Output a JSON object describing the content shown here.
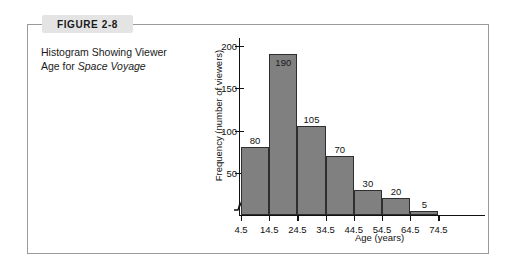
{
  "figure": {
    "badge_label": "FIGURE 2-8",
    "caption_line1": "Histogram Showing Viewer",
    "caption_line2_prefix": "Age for ",
    "caption_line2_italic": "Space Voyage"
  },
  "colors": {
    "bar_fill": "#808080",
    "bar_stroke": "#2e2e2e",
    "frame": "#9a9a9a",
    "badge_bg": "#e4e4e4",
    "text": "#1a1a1a"
  },
  "chart_data": {
    "type": "bar",
    "title": "Histogram Showing Viewer Age for Space Voyage",
    "xlabel": "Age (years)",
    "ylabel": "Frequency (number of viewers)",
    "categories": [
      "4.5-14.5",
      "14.5-24.5",
      "24.5-34.5",
      "34.5-44.5",
      "44.5-54.5",
      "54.5-64.5",
      "64.5-74.5"
    ],
    "values": [
      80,
      190,
      105,
      70,
      30,
      20,
      5
    ],
    "bin_edges": [
      4.5,
      14.5,
      24.5,
      34.5,
      44.5,
      54.5,
      64.5,
      74.5
    ],
    "x_tick_labels": [
      "4.5",
      "14.5",
      "24.5",
      "34.5",
      "44.5",
      "54.5",
      "64.5",
      "74.5"
    ],
    "y_tick_labels": [
      "50",
      "100",
      "150",
      "200"
    ],
    "y_ticks": [
      50,
      100,
      150,
      200
    ],
    "ylim": [
      0,
      200
    ],
    "grid": false,
    "legend": false,
    "axis_break": "y-axis-break-symbol",
    "data_labels": [
      "80",
      "190",
      "105",
      "70",
      "30",
      "20",
      "5"
    ]
  }
}
